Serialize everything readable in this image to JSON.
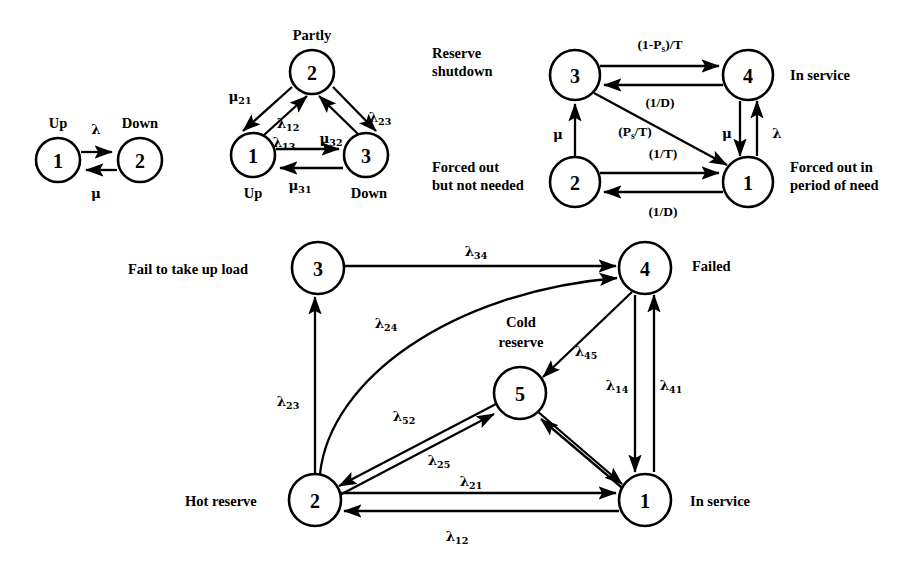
{
  "figure": {
    "background_color": "#ffffff",
    "line_color": "#000000"
  },
  "diagrams": [
    {
      "id": "two-state-model",
      "name": "Two state model",
      "nodes": [
        {
          "id": "d1n1",
          "label": "1",
          "state_name": "Up",
          "cx": 58,
          "cy": 160,
          "r": 22
        },
        {
          "id": "d1n2",
          "label": "2",
          "state_name": "Down",
          "cx": 140,
          "cy": 160,
          "r": 22
        }
      ],
      "edges": [
        {
          "id": "d1e12",
          "from": "1",
          "to": "2",
          "rate": "λ",
          "sub": "",
          "lx": 96,
          "ly": 127
        },
        {
          "id": "d1e21",
          "from": "2",
          "to": "1",
          "rate": "μ",
          "sub": "",
          "lx": 95,
          "ly": 202
        }
      ]
    },
    {
      "id": "three-state-model",
      "name": "Three state model",
      "nodes": [
        {
          "id": "d2n2",
          "label": "2",
          "state_name": "Partly",
          "cx": 312,
          "cy": 72,
          "r": 22
        },
        {
          "id": "d2n1",
          "label": "1",
          "state_name": "Up",
          "cx": 253,
          "cy": 155,
          "r": 22
        },
        {
          "id": "d2n3",
          "label": "3",
          "state_name": "Down",
          "cx": 366,
          "cy": 155,
          "r": 22
        }
      ],
      "edges": [
        {
          "id": "d2e21",
          "from": "2",
          "to": "1",
          "rate": "μ",
          "sub": "21",
          "lx": 240,
          "ly": 97
        },
        {
          "id": "d2e12",
          "from": "1",
          "to": "2",
          "rate": "λ",
          "sub": "12",
          "lx": 288,
          "ly": 124
        },
        {
          "id": "d2e23",
          "from": "2",
          "to": "3",
          "rate": "λ",
          "sub": "23",
          "lx": 372,
          "ly": 118
        },
        {
          "id": "d2e32",
          "from": "3",
          "to": "2",
          "rate": "μ",
          "sub": "32",
          "lx": 325,
          "ly": 139
        },
        {
          "id": "d2e13",
          "from": "1",
          "to": "3",
          "rate": "λ",
          "sub": "13",
          "lx": 278,
          "ly": 148
        },
        {
          "id": "d2e31",
          "from": "3",
          "to": "1",
          "rate": "μ",
          "sub": "31",
          "lx": 294,
          "ly": 190
        }
      ]
    },
    {
      "id": "four-state-reserve-model",
      "name": "Four state reserve model",
      "nodes": [
        {
          "id": "d3n3",
          "label": "3",
          "state_name": "Reserve shutdown",
          "cx": 575,
          "cy": 75,
          "r": 25
        },
        {
          "id": "d3n4",
          "label": "4",
          "state_name": "In service",
          "cx": 748,
          "cy": 75,
          "r": 25
        },
        {
          "id": "d3n2",
          "label": "2",
          "state_name": "Forced out but not needed",
          "cx": 575,
          "cy": 182,
          "r": 25
        },
        {
          "id": "d3n1",
          "label": "1",
          "state_name": "Forced out in period of need",
          "cx": 748,
          "cy": 182,
          "r": 25
        }
      ],
      "state_labels": [
        {
          "id": "d3l3",
          "text_line1": "Reserve",
          "text_line2": "shutdown",
          "x": 432,
          "y": 52,
          "align": "left"
        },
        {
          "id": "d3l4",
          "text_line1": "In service",
          "text_line2": "",
          "x": 786,
          "y": 68,
          "align": "left"
        },
        {
          "id": "d3l2",
          "text_line1": "Forced out",
          "text_line2": "but not needed",
          "x": 432,
          "y": 166,
          "align": "left"
        },
        {
          "id": "d3l1",
          "text_line1": "Forced out in",
          "text_line2": "period of need",
          "x": 786,
          "y": 166,
          "align": "left"
        }
      ],
      "edges": [
        {
          "id": "d3e34",
          "from": "3",
          "to": "4",
          "rate": "(1-P",
          "sub": "s",
          "rate_tail": ")/T",
          "lx": 634,
          "ly": 43
        },
        {
          "id": "d3e43",
          "from": "4",
          "to": "3",
          "rate": "(1/D)",
          "sub": "",
          "lx": 644,
          "ly": 110
        },
        {
          "id": "d3e23",
          "from": "2",
          "to": "3",
          "rate": "μ",
          "sub": "",
          "lx": 545,
          "ly": 133
        },
        {
          "id": "d3e31",
          "from": "3",
          "to": "1",
          "rate": "(P",
          "sub": "s",
          "rate_tail": "/T)",
          "lx": 617,
          "ly": 132
        },
        {
          "id": "d3e21",
          "from": "2",
          "to": "1",
          "rate": "(1/T)",
          "sub": "",
          "lx": 647,
          "ly": 153
        },
        {
          "id": "d3e12",
          "from": "1",
          "to": "2",
          "rate": "(1/D)",
          "sub": "",
          "lx": 647,
          "ly": 215
        },
        {
          "id": "d3e41",
          "from": "4",
          "to": "1",
          "rate": "μ",
          "sub": "",
          "lx": 723,
          "ly": 133
        },
        {
          "id": "d3e14",
          "from": "1",
          "to": "4",
          "rate": "λ",
          "sub": "",
          "lx": 772,
          "ly": 133
        }
      ]
    },
    {
      "id": "five-state-model",
      "name": "Five state model",
      "nodes": [
        {
          "id": "d4n3",
          "label": "3",
          "state_name": "Fail to take up load",
          "cx": 318,
          "cy": 268,
          "r": 26
        },
        {
          "id": "d4n4",
          "label": "4",
          "state_name": "Failed",
          "cx": 645,
          "cy": 268,
          "r": 26
        },
        {
          "id": "d4n5",
          "label": "5",
          "state_name": "Cold reserve",
          "cx": 520,
          "cy": 393,
          "r": 26
        },
        {
          "id": "d4n2",
          "label": "2",
          "state_name": "Hot reserve",
          "cx": 315,
          "cy": 500,
          "r": 26
        },
        {
          "id": "d4n1",
          "label": "1",
          "state_name": "In service",
          "cx": 645,
          "cy": 500,
          "r": 26
        }
      ],
      "state_labels": [
        {
          "id": "d4l3",
          "text_line1": "Fail to take up load",
          "text_line2": "",
          "x": 128,
          "y": 270,
          "align": "left"
        },
        {
          "id": "d4l4",
          "text_line1": "Failed",
          "text_line2": "",
          "x": 690,
          "y": 266,
          "align": "left"
        },
        {
          "id": "d4l5",
          "text_line1": "Cold",
          "text_line2": "reserve",
          "x": 520,
          "y": 336,
          "align": "center"
        },
        {
          "id": "d4l2",
          "text_line1": "Hot reserve",
          "text_line2": "",
          "x": 185,
          "y": 503,
          "align": "left"
        },
        {
          "id": "d4l1",
          "text_line1": "In service",
          "text_line2": "",
          "x": 688,
          "y": 503,
          "align": "left"
        }
      ],
      "edges": [
        {
          "id": "d4e34",
          "from": "3",
          "to": "4",
          "rate": "λ",
          "sub": "34",
          "lx": 473,
          "ly": 253
        },
        {
          "id": "d4e24",
          "from": "2",
          "to": "4",
          "rate": "λ",
          "sub": "24",
          "lx": 382,
          "ly": 324
        },
        {
          "id": "d4e23",
          "from": "2",
          "to": "3",
          "rate": "λ",
          "sub": "23",
          "lx": 283,
          "ly": 402
        },
        {
          "id": "d4e45",
          "from": "4",
          "to": "5",
          "rate": "λ",
          "sub": "45",
          "lx": 581,
          "ly": 352
        },
        {
          "id": "d4e52",
          "from": "5",
          "to": "2",
          "rate": "λ",
          "sub": "52",
          "lx": 399,
          "ly": 417
        },
        {
          "id": "d4e25",
          "from": "2",
          "to": "5",
          "rate": "λ",
          "sub": "25",
          "lx": 434,
          "ly": 461
        },
        {
          "id": "d4e14",
          "from": "1",
          "to": "4",
          "rate": "λ",
          "sub": "14",
          "lx": 612,
          "ly": 386
        },
        {
          "id": "d4e41",
          "from": "4",
          "to": "1",
          "rate": "λ",
          "sub": "41",
          "lx": 666,
          "ly": 386
        },
        {
          "id": "d4e21",
          "from": "2",
          "to": "1",
          "rate": "λ",
          "sub": "21",
          "lx": 466,
          "ly": 482
        },
        {
          "id": "d4e12",
          "from": "1",
          "to": "2",
          "rate": "λ",
          "sub": "12",
          "lx": 452,
          "ly": 537
        }
      ]
    }
  ]
}
